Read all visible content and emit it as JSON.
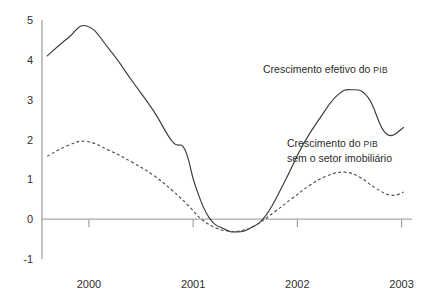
{
  "chart_data": {
    "type": "line",
    "title": "",
    "subtitle": "",
    "xlabel": "",
    "ylabel": "",
    "xlim": [
      1999.55,
      2003.1
    ],
    "ylim": [
      -1,
      5
    ],
    "grid": false,
    "legend_position": "inline-annotation",
    "y_ticks": [
      5,
      4,
      3,
      2,
      1,
      0,
      -1
    ],
    "y_tick_labels": [
      "5",
      "4",
      "3",
      "2",
      "1",
      "0",
      "-1"
    ],
    "x_ticks": [
      2000,
      2001,
      2002,
      2003
    ],
    "x_tick_labels": [
      "2000",
      "2001",
      "2002",
      "2003"
    ],
    "zero_line": 0,
    "series": [
      {
        "name": "Crescimento efetivo do PIB",
        "style": "solid",
        "color": "#3a3a3a",
        "x": [
          1999.6,
          1999.8,
          1999.98,
          2000.2,
          2000.42,
          2000.62,
          2000.8,
          2000.92,
          2001.02,
          2001.15,
          2001.3,
          2001.42,
          2001.55,
          2001.7,
          2001.88,
          2002.05,
          2002.22,
          2002.38,
          2002.52,
          2002.68,
          2002.85,
          2003.02
        ],
        "y": [
          4.1,
          4.55,
          4.85,
          4.25,
          3.45,
          2.72,
          1.95,
          1.75,
          0.85,
          0.05,
          -0.25,
          -0.32,
          -0.22,
          0.1,
          0.95,
          1.85,
          2.55,
          3.1,
          3.25,
          3.05,
          2.15,
          2.3
        ]
      },
      {
        "name": "Crescimento do PIB sem o setor imobiliário",
        "style": "dashed",
        "color": "#4a4a4a",
        "x": [
          1999.6,
          1999.8,
          1999.98,
          2000.2,
          2000.42,
          2000.62,
          2000.8,
          2000.95,
          2001.08,
          2001.22,
          2001.35,
          2001.48,
          2001.62,
          2001.78,
          2001.95,
          2002.12,
          2002.28,
          2002.45,
          2002.6,
          2002.75,
          2002.9,
          2003.02
        ],
        "y": [
          1.58,
          1.85,
          1.95,
          1.72,
          1.42,
          1.1,
          0.72,
          0.35,
          0.0,
          -0.22,
          -0.3,
          -0.28,
          -0.12,
          0.18,
          0.52,
          0.85,
          1.08,
          1.18,
          1.05,
          0.78,
          0.6,
          0.68
        ]
      }
    ],
    "annotations": [
      {
        "id": "annotation-efetivo",
        "lines": [
          {
            "segments": [
              {
                "text": "Crescimento efetivo do ",
                "smallcaps": false
              },
              {
                "text": "PIB",
                "smallcaps": true
              }
            ]
          }
        ],
        "x_px": 263,
        "y_px": 73,
        "anchor": "start"
      },
      {
        "id": "annotation-sem-imobiliario",
        "lines": [
          {
            "segments": [
              {
                "text": "Crescimento do ",
                "smallcaps": false
              },
              {
                "text": "PIB",
                "smallcaps": true
              }
            ]
          },
          {
            "segments": [
              {
                "text": "sem o setor imobiliário",
                "smallcaps": false
              }
            ]
          }
        ],
        "x_px": 287,
        "y_px": 147,
        "anchor": "start"
      }
    ],
    "colors": {
      "axis": "#9a9a9a",
      "zero_line": "#a8a8a8",
      "text": "#2b2b2b",
      "background": "#ffffff"
    }
  }
}
